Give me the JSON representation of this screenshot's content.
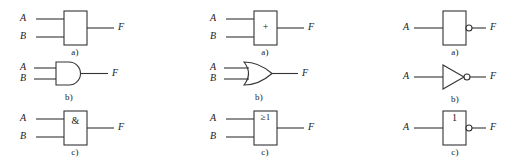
{
  "figure": {
    "background_color": "#ffffff",
    "stroke_color": "#333333",
    "text_color": "#1a1a1a",
    "columns": [
      {
        "name": "and-column",
        "rows": [
          {
            "caption": "a)",
            "symbol": "rectangle-plain",
            "inner_label": "",
            "bubble": false,
            "inputs": [
              "A",
              "B"
            ],
            "output": "F"
          },
          {
            "caption": "b)",
            "symbol": "distinctive-and",
            "inner_label": "",
            "bubble": false,
            "inputs": [
              "A",
              "B"
            ],
            "output": "F"
          },
          {
            "caption": "c)",
            "symbol": "rectangle-labeled",
            "inner_label": "&",
            "bubble": false,
            "inputs": [
              "A",
              "B"
            ],
            "output": "F"
          }
        ]
      },
      {
        "name": "or-column",
        "rows": [
          {
            "caption": "a)",
            "symbol": "rectangle-labeled",
            "inner_label": "+",
            "bubble": false,
            "inputs": [
              "A",
              "B"
            ],
            "output": "F"
          },
          {
            "caption": "b)",
            "symbol": "distinctive-or",
            "inner_label": "",
            "bubble": false,
            "inputs": [
              "A",
              "B"
            ],
            "output": "F"
          },
          {
            "caption": "c)",
            "symbol": "rectangle-labeled-top",
            "inner_label": "≥1",
            "bubble": false,
            "inputs": [
              "A",
              "B"
            ],
            "output": "F"
          }
        ]
      },
      {
        "name": "not-column",
        "rows": [
          {
            "caption": "a)",
            "symbol": "rectangle-plain",
            "inner_label": "",
            "bubble": true,
            "inputs": [
              "A"
            ],
            "output": "F"
          },
          {
            "caption": "b)",
            "symbol": "distinctive-not",
            "inner_label": "",
            "bubble": true,
            "inputs": [
              "A"
            ],
            "output": "F"
          },
          {
            "caption": "c)",
            "symbol": "rectangle-labeled-top",
            "inner_label": "1",
            "bubble": true,
            "inputs": [
              "A"
            ],
            "output": "F"
          }
        ]
      }
    ]
  }
}
